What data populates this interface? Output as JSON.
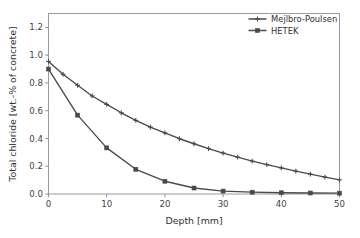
{
  "chart_data": {
    "type": "line",
    "title": "",
    "xlabel": "Depth [mm]",
    "ylabel": "Total chloride [wt.-% of concrete]",
    "xlim": [
      0,
      50
    ],
    "ylim": [
      0.0,
      1.3
    ],
    "xticks": [
      0,
      10,
      20,
      30,
      40,
      50
    ],
    "xtick_labels": [
      "0",
      "10",
      "20",
      "30",
      "40",
      "50"
    ],
    "yticks": [
      0.0,
      0.2,
      0.4,
      0.6,
      0.8,
      1.0,
      1.2
    ],
    "ytick_labels": [
      "0.0",
      "0.2",
      "0.4",
      "0.6",
      "0.8",
      "1.0",
      "1.2"
    ],
    "grid": false,
    "legend_position": "top-right",
    "line_color": "#4a4a4a",
    "frame_color": "#9a9a9a",
    "background": "#ffffff",
    "series": [
      {
        "name": "Mejlbro-Poulsen",
        "marker": "cross",
        "x": [
          0,
          2.5,
          5,
          7.5,
          10,
          12.5,
          15,
          17.5,
          20,
          22.5,
          25,
          27.5,
          30,
          32.5,
          35,
          37.5,
          40,
          42.5,
          45,
          47.5,
          50
        ],
        "values": [
          0.955,
          0.862,
          0.783,
          0.706,
          0.645,
          0.585,
          0.53,
          0.482,
          0.44,
          0.398,
          0.362,
          0.327,
          0.295,
          0.265,
          0.237,
          0.212,
          0.188,
          0.165,
          0.143,
          0.122,
          0.102
        ]
      },
      {
        "name": "HETEK",
        "marker": "square",
        "x": [
          0,
          5,
          10,
          15,
          20,
          25,
          30,
          35,
          40,
          45,
          50
        ],
        "values": [
          0.9,
          0.568,
          0.332,
          0.178,
          0.092,
          0.043,
          0.021,
          0.013,
          0.009,
          0.007,
          0.006
        ]
      }
    ]
  },
  "legend": {
    "entries": [
      {
        "label": "Mejlbro-Poulsen"
      },
      {
        "label": "HETEK"
      }
    ]
  }
}
